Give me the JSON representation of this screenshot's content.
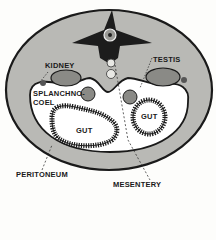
{
  "diagram": {
    "labels": {
      "kidney": "KIDNEY",
      "testis": "TESTIS",
      "splanchnocoel_line1": "SPLANCHNO-",
      "splanchnocoel_line2": "COEL",
      "gut_left": "GUT",
      "gut_right": "GUT",
      "peritoneum": "PERITONEUM",
      "mesentery": "MESENTERY"
    },
    "colors": {
      "body_wall": "#b9b9b5",
      "outline": "#1a1a1a",
      "cavity": "#ffffff",
      "organ_fill": "#8a8a86",
      "background": "#fdfdfb"
    }
  }
}
